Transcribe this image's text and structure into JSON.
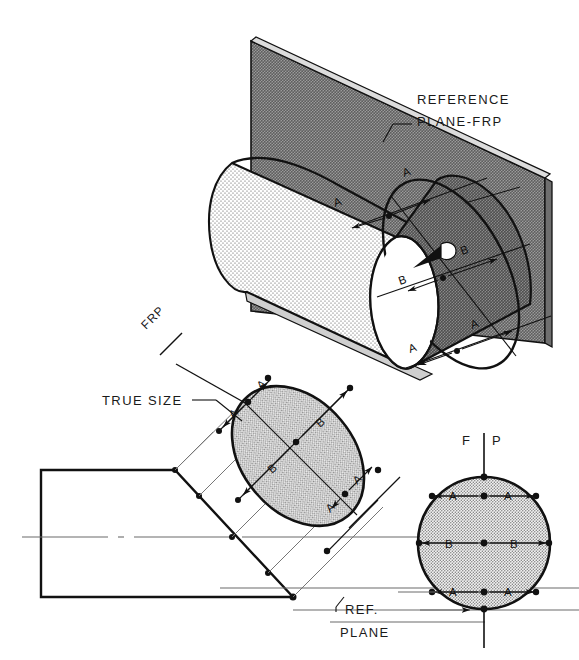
{
  "figure": {
    "kind": "engineering-drawing",
    "background_color": "#ffffff",
    "line_color": "#111111",
    "thin_line_color": "#666666",
    "plane_fill_color": "#8d8d8d",
    "plane_fill_dark": "#7a7a7a",
    "cylinder_fill_color": "#ededed",
    "ellipse_fill_color": "#e4e4e4",
    "circle_fill_color": "#e6e6e6"
  },
  "labels": {
    "reference_plane_line1": "REFERENCE",
    "reference_plane_line2": "PLANE-FRP",
    "frp": "FRP",
    "true_size": "TRUE SIZE",
    "ref_line1": "REF.",
    "ref_line2": "PLANE",
    "fold_front": "F",
    "fold_profile": "P"
  },
  "dimension_marks": {
    "major": "B",
    "minor": "A"
  },
  "pictorial_view": {
    "name": "pictorial-cut-cylinder",
    "dims": [
      {
        "label": "A",
        "x": 335,
        "y": 203
      },
      {
        "label": "A",
        "x": 404,
        "y": 173
      },
      {
        "label": "B",
        "x": 403,
        "y": 281
      },
      {
        "label": "B",
        "x": 460,
        "y": 251
      },
      {
        "label": "A",
        "x": 412,
        "y": 349
      },
      {
        "label": "A",
        "x": 470,
        "y": 325
      }
    ]
  },
  "auxiliary_view": {
    "name": "auxiliary-true-size-ellipse",
    "dims": [
      {
        "label": "A",
        "x": 236,
        "y": 415
      },
      {
        "label": "A",
        "x": 264,
        "y": 386
      },
      {
        "label": "B",
        "x": 276,
        "y": 470
      },
      {
        "label": "B",
        "x": 323,
        "y": 424
      },
      {
        "label": "A",
        "x": 333,
        "y": 509
      },
      {
        "label": "A",
        "x": 360,
        "y": 481
      }
    ]
  },
  "profile_view": {
    "name": "profile-circle-view",
    "dims": [
      {
        "label": "A",
        "x": 452,
        "y": 496
      },
      {
        "label": "A",
        "x": 505,
        "y": 496
      },
      {
        "label": "B",
        "x": 449,
        "y": 545
      },
      {
        "label": "B",
        "x": 513,
        "y": 545
      },
      {
        "label": "A",
        "x": 452,
        "y": 592
      },
      {
        "label": "A",
        "x": 505,
        "y": 592
      }
    ]
  },
  "front_view": {
    "name": "front-view-cut-cylinder",
    "has_centerline": true
  }
}
